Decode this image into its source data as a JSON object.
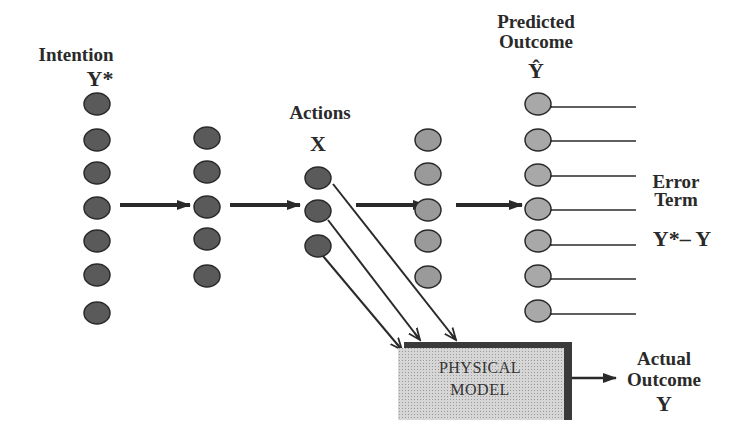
{
  "diagram": {
    "labels": {
      "intention_title": "Intention",
      "intention_symbol": "Y*",
      "actions_title": "Actions",
      "actions_symbol": "X",
      "predicted_title_1": "Predicted",
      "predicted_title_2": "Outcome",
      "predicted_symbol": "Ŷ",
      "error_title_1": "Error",
      "error_title_2": "Term",
      "error_formula": "Y*– Y",
      "actual_title_1": "Actual",
      "actual_title_2": "Outcome",
      "actual_symbol": "Y",
      "model_line_1": "PHYSICAL",
      "model_line_2": "MODEL"
    },
    "layers": [
      {
        "name": "intention",
        "x": 97,
        "nodes": [
          104,
          140,
          173,
          208,
          241,
          275,
          313
        ],
        "fill": "#5a5a5a"
      },
      {
        "name": "hidden-1",
        "x": 207,
        "nodes": [
          138,
          172,
          207,
          239,
          276
        ],
        "fill": "#5a5a5a"
      },
      {
        "name": "actions",
        "x": 318,
        "nodes": [
          178,
          211,
          246
        ],
        "fill": "#5a5a5a"
      },
      {
        "name": "hidden-2",
        "x": 428,
        "nodes": [
          140,
          174,
          210,
          241,
          277
        ],
        "fill": "#9a9a9a"
      },
      {
        "name": "predicted-outcome",
        "x": 538,
        "nodes": [
          104,
          140,
          175,
          209,
          241,
          276,
          311
        ],
        "fill": "#a8a8a8"
      }
    ],
    "colors": {
      "ink": "#2a2a2a",
      "box_fill": "#d4d4d4",
      "box_shadow": "#3a3a3a"
    }
  }
}
